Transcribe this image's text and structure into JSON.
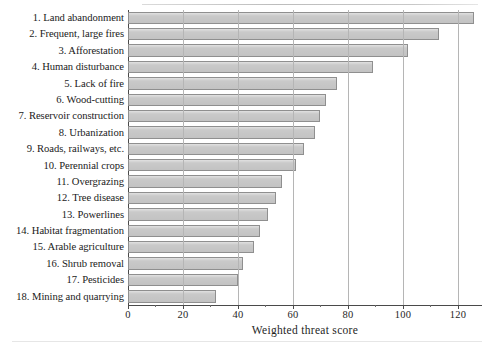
{
  "chart_data": {
    "type": "bar",
    "orientation": "horizontal",
    "title": "",
    "xlabel": "Weighted threat score",
    "ylabel": "",
    "xlim": [
      0,
      127.3
    ],
    "xticks": [
      0,
      20,
      40,
      60,
      80,
      100,
      120
    ],
    "xtick_labels": [
      "0",
      "20",
      "40",
      "60",
      "80",
      "100",
      "120"
    ],
    "grid": "vertical",
    "legend": "none",
    "bar_color": "#c9c9c9",
    "bar_edge_color": "#8f8f8f",
    "categories": [
      "1. Land abandonment",
      "2. Frequent, large fires",
      "3. Afforestation",
      "4. Human disturbance",
      "5. Lack of fire",
      "6. Wood-cutting",
      "7. Reservoir construction",
      "8. Urbanization",
      "9. Roads, railways, etc.",
      "10. Perennial crops",
      "11. Overgrazing",
      "12. Tree disease",
      "13. Powerlines",
      "14. Habitat fragmentation",
      "15. Arable agriculture",
      "16. Shrub removal",
      "17. Pesticides",
      "18. Mining and quarrying"
    ],
    "values": [
      126,
      113,
      102,
      89,
      76,
      72,
      70,
      68,
      64,
      61,
      56,
      54,
      51,
      48,
      46,
      42,
      40,
      32
    ]
  },
  "axis": {
    "x_title": "Weighted threat score"
  }
}
